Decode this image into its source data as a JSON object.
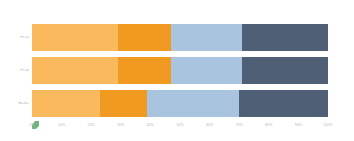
{
  "chart_data": {
    "type": "bar",
    "orientation": "horizontal",
    "stacked": true,
    "normalized_percent": true,
    "title": "",
    "subtitle": "",
    "xlabel": "",
    "ylabel": "",
    "xlim": [
      0,
      100
    ],
    "grid": false,
    "legend_position": "none",
    "categories": [
      "FY23",
      "FY24",
      "MCSC"
    ],
    "tick_labels": [
      "0%",
      "10%",
      "20%",
      "30%",
      "40%",
      "50%",
      "60%",
      "70%",
      "80%",
      "90%",
      "100%"
    ],
    "tick_values": [
      0,
      10,
      20,
      30,
      40,
      50,
      60,
      70,
      80,
      90,
      100
    ],
    "series": [
      {
        "name": "Segment 1",
        "color": "#f9b95c",
        "values": [
          29,
          29,
          23
        ]
      },
      {
        "name": "Segment 2",
        "color": "#f09a22",
        "values": [
          18,
          18,
          16
        ]
      },
      {
        "name": "Segment 3",
        "color": "#a8c4de",
        "values": [
          24,
          24,
          31
        ]
      },
      {
        "name": "Segment 4",
        "color": "#4f6076",
        "values": [
          29,
          29,
          30
        ]
      }
    ]
  },
  "colors": {
    "background": "#ffffff",
    "segment_1": "#f9b95c",
    "segment_2": "#f09a22",
    "segment_3": "#a8c4de",
    "segment_4": "#4f6076",
    "axis_text": "#b0b4b8",
    "category_text": "#9aa0a6",
    "origin_marker": "#5aa86b"
  },
  "icons": {
    "origin_marker": "green-flag-marker-icon"
  }
}
